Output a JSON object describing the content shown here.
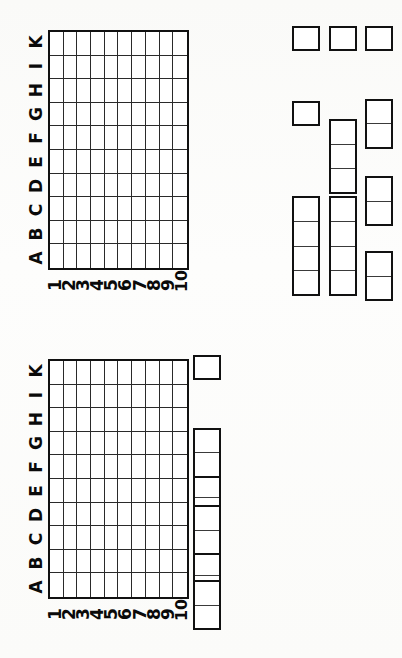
{
  "sheet": {
    "kind": "battleship-paper-grid-sheet",
    "orientation_note": "rotated-90",
    "board_count": 2
  },
  "axes": {
    "column_letters": [
      "A",
      "B",
      "C",
      "D",
      "E",
      "F",
      "G",
      "H",
      "I",
      "K"
    ],
    "row_numbers": [
      "1",
      "2",
      "3",
      "4",
      "5",
      "6",
      "7",
      "8",
      "9",
      "10"
    ],
    "grid_columns": 10,
    "grid_rows": 10
  },
  "fleet": {
    "columns": [
      {
        "name": "fleet-column-1",
        "ships": [
          {
            "label": "1",
            "length": 1,
            "offset_units": 0
          },
          {
            "label": "1",
            "length": 1,
            "offset_units": 3
          },
          {
            "label": "4",
            "length": 4,
            "offset_units": 6.8
          }
        ]
      },
      {
        "name": "fleet-column-2",
        "ships": [
          {
            "label": "1",
            "length": 1,
            "offset_units": 0
          },
          {
            "label": "3",
            "length": 3,
            "offset_units": 3.7
          },
          {
            "label": "4",
            "length": 4,
            "offset_units": 6.8
          }
        ]
      },
      {
        "name": "fleet-column-3",
        "ships": [
          {
            "label": "1",
            "length": 1,
            "offset_units": 0
          },
          {
            "label": "2",
            "length": 2,
            "offset_units": 2.9
          },
          {
            "label": "2",
            "length": 2,
            "offset_units": 6.0
          },
          {
            "label": "2",
            "length": 2,
            "offset_units": 9.0
          }
        ]
      }
    ]
  },
  "colors": {
    "ink": "#111111",
    "rule": "#2a2a2a",
    "paper": "#fdfdfc"
  }
}
